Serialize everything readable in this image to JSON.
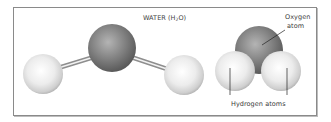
{
  "diagram": {
    "title": {
      "prefix": "WATER (H",
      "subscript": "2",
      "suffix": "O)"
    },
    "models": [
      {
        "kind": "ball-and-stick",
        "atoms": [
          {
            "element": "H",
            "cx": 43,
            "cy": 74,
            "r": 20
          },
          {
            "element": "O",
            "cx": 112,
            "cy": 48,
            "r": 24
          },
          {
            "element": "H",
            "cx": 184,
            "cy": 75,
            "r": 20
          }
        ],
        "bonds": [
          {
            "from": "H-left",
            "to": "O"
          },
          {
            "from": "O",
            "to": "H-right"
          }
        ]
      },
      {
        "kind": "space-filling",
        "atoms": [
          {
            "element": "O",
            "cx": 259,
            "cy": 50,
            "r": 24
          },
          {
            "element": "H",
            "cx": 235,
            "cy": 71,
            "r": 20
          },
          {
            "element": "H",
            "cx": 281,
            "cy": 71,
            "r": 20
          }
        ]
      }
    ],
    "labels": {
      "oxygen_line1": "Oxygen",
      "oxygen_line2": "atom",
      "hydrogen": "Hydrogen atoms"
    },
    "colors": {
      "oxygen": "#7a7a7a",
      "hydrogen": "#e6e6e6",
      "frame": "#8a8a8a",
      "text": "#3a3a3a"
    }
  }
}
